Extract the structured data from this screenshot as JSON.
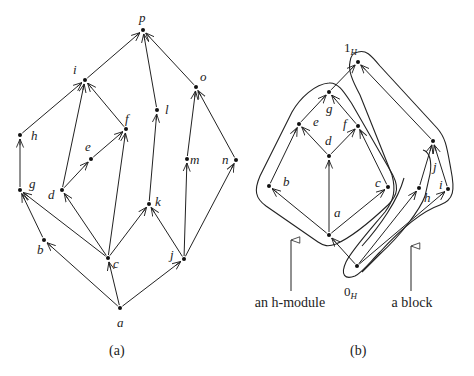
{
  "diagram_a": {
    "caption": "(a)",
    "nodes": [
      {
        "id": "p",
        "x": 143,
        "y": 30,
        "label": "p",
        "lx": -4,
        "ly": -8
      },
      {
        "id": "i",
        "x": 85,
        "y": 80,
        "label": "i",
        "lx": -12,
        "ly": -6
      },
      {
        "id": "o",
        "x": 196,
        "y": 87,
        "label": "o",
        "lx": 4,
        "ly": -6
      },
      {
        "id": "l",
        "x": 157,
        "y": 110,
        "label": "l",
        "lx": 8,
        "ly": 4
      },
      {
        "id": "h",
        "x": 20,
        "y": 135,
        "label": "h",
        "lx": 11,
        "ly": 5
      },
      {
        "id": "f",
        "x": 126,
        "y": 129,
        "label": "f",
        "lx": -1,
        "ly": -6
      },
      {
        "id": "e",
        "x": 91,
        "y": 159,
        "label": "e",
        "lx": -6,
        "ly": -8
      },
      {
        "id": "m",
        "x": 187,
        "y": 159,
        "label": "m",
        "lx": 3,
        "ly": 5
      },
      {
        "id": "n",
        "x": 236,
        "y": 160,
        "label": "n",
        "lx": -14,
        "ly": 4
      },
      {
        "id": "g",
        "x": 20,
        "y": 190,
        "label": "g",
        "lx": 9,
        "ly": -2
      },
      {
        "id": "d",
        "x": 62,
        "y": 190,
        "label": "d",
        "lx": -14,
        "ly": 9
      },
      {
        "id": "k",
        "x": 149,
        "y": 204,
        "label": "k",
        "lx": 6,
        "ly": 2
      },
      {
        "id": "b",
        "x": 44,
        "y": 240,
        "label": "b",
        "lx": -7,
        "ly": 14
      },
      {
        "id": "c",
        "x": 108,
        "y": 258,
        "label": "c",
        "lx": 5,
        "ly": 10
      },
      {
        "id": "j",
        "x": 184,
        "y": 259,
        "label": "j",
        "lx": -14,
        "ly": 0
      },
      {
        "id": "a",
        "x": 120,
        "y": 308,
        "label": "a",
        "lx": -3,
        "ly": 19
      }
    ],
    "edges": [
      [
        "i",
        "p"
      ],
      [
        "l",
        "p"
      ],
      [
        "o",
        "p"
      ],
      [
        "h",
        "i"
      ],
      [
        "d",
        "i"
      ],
      [
        "f",
        "i"
      ],
      [
        "g",
        "h"
      ],
      [
        "e",
        "f"
      ],
      [
        "d",
        "e"
      ],
      [
        "c",
        "f"
      ],
      [
        "k",
        "l"
      ],
      [
        "m",
        "o"
      ],
      [
        "n",
        "o"
      ],
      [
        "b",
        "g"
      ],
      [
        "c",
        "g"
      ],
      [
        "c",
        "d"
      ],
      [
        "c",
        "k"
      ],
      [
        "j",
        "k"
      ],
      [
        "j",
        "m"
      ],
      [
        "j",
        "n"
      ],
      [
        "a",
        "b"
      ],
      [
        "a",
        "c"
      ],
      [
        "a",
        "j"
      ]
    ]
  },
  "diagram_b": {
    "caption": "(b)",
    "nodes": [
      {
        "id": "1H",
        "x": 358,
        "y": 62,
        "label": "1",
        "sub": "H",
        "lx": -14,
        "ly": -10
      },
      {
        "id": "g",
        "x": 329,
        "y": 92,
        "label": "g",
        "lx": -3,
        "ly": 21
      },
      {
        "id": "e",
        "x": 299,
        "y": 124,
        "label": "e",
        "lx": 14,
        "ly": 2
      },
      {
        "id": "f",
        "x": 358,
        "y": 126,
        "label": "f",
        "lx": -15,
        "ly": 2
      },
      {
        "id": "d",
        "x": 329,
        "y": 156,
        "label": "d",
        "lx": -4,
        "ly": -11
      },
      {
        "id": "j",
        "x": 433,
        "y": 141,
        "label": "j",
        "lx": 0,
        "ly": 30
      },
      {
        "id": "b",
        "x": 269,
        "y": 186,
        "label": "b",
        "lx": 14,
        "ly": 0
      },
      {
        "id": "c",
        "x": 388,
        "y": 187,
        "label": "c",
        "lx": -13,
        "ly": 0
      },
      {
        "id": "h",
        "x": 419,
        "y": 188,
        "label": "h",
        "lx": 5,
        "ly": 14
      },
      {
        "id": "i",
        "x": 448,
        "y": 189,
        "label": "i",
        "lx": -9,
        "ly": 0
      },
      {
        "id": "a",
        "x": 329,
        "y": 235,
        "label": "a",
        "lx": 5,
        "ly": -18
      },
      {
        "id": "0H",
        "x": 357,
        "y": 266,
        "label": "0",
        "sub": "H",
        "lx": -13,
        "ly": 30
      }
    ],
    "edges": [
      [
        "g",
        "1H"
      ],
      [
        "j",
        "1H"
      ],
      [
        "e",
        "g"
      ],
      [
        "f",
        "g"
      ],
      [
        "d",
        "e"
      ],
      [
        "d",
        "f"
      ],
      [
        "b",
        "e"
      ],
      [
        "a",
        "d"
      ],
      [
        "c",
        "f"
      ],
      [
        "h",
        "j"
      ],
      [
        "i",
        "j"
      ],
      [
        "a",
        "b"
      ],
      [
        "a",
        "c"
      ],
      [
        "0H",
        "a"
      ],
      [
        "0H",
        "h"
      ],
      [
        "0H",
        "i"
      ]
    ],
    "annotations": [
      {
        "text": "an h-module",
        "x": 290,
        "y": 307,
        "arrow_x": 291,
        "arrow_y1": 291,
        "arrow_y2": 240
      },
      {
        "text": "a block",
        "x": 412,
        "y": 307,
        "arrow_x": 411,
        "arrow_y1": 291,
        "arrow_y2": 246
      }
    ]
  }
}
